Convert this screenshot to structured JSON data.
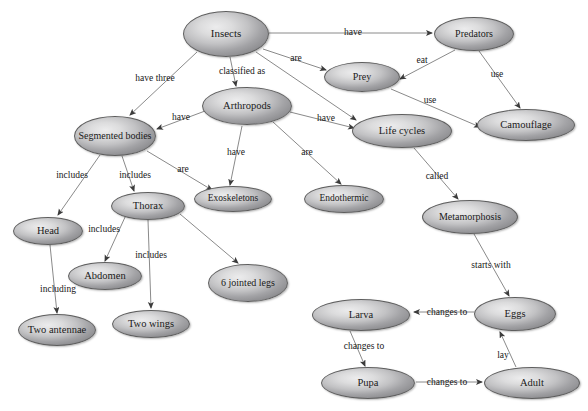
{
  "diagram": {
    "type": "concept-map",
    "canvas": {
      "width": 588,
      "height": 411
    },
    "style": {
      "node_fill_light": "#ececed",
      "node_fill_dark": "#8d8d90",
      "node_border": "#5e5e5e",
      "edge_color": "#8a8a8a",
      "text_color": "#1a1a1a",
      "background": "#ffffff"
    },
    "nodes": [
      {
        "id": "insects",
        "label": "Insects",
        "cx": 226,
        "cy": 34,
        "rx": 43,
        "ry": 23,
        "fontSize": 11
      },
      {
        "id": "predators",
        "label": "Predators",
        "cx": 474,
        "cy": 34,
        "rx": 40,
        "ry": 17,
        "fontSize": 10
      },
      {
        "id": "prey",
        "label": "Prey",
        "cx": 362,
        "cy": 77,
        "rx": 38,
        "ry": 15,
        "fontSize": 10
      },
      {
        "id": "arthropods",
        "label": "Arthropods",
        "cx": 247,
        "cy": 106,
        "rx": 45,
        "ry": 19,
        "fontSize": 10.5
      },
      {
        "id": "segmented",
        "label": "Segmented bodies",
        "cx": 115,
        "cy": 136,
        "rx": 41,
        "ry": 20,
        "fontSize": 10
      },
      {
        "id": "lifecycles",
        "label": "Life cycles",
        "cx": 402,
        "cy": 131,
        "rx": 50,
        "ry": 17,
        "fontSize": 10.5
      },
      {
        "id": "camouflage",
        "label": "Camouflage",
        "cx": 526,
        "cy": 125,
        "rx": 49,
        "ry": 16,
        "fontSize": 10.5
      },
      {
        "id": "exoskeletons",
        "label": "Exoskeletons",
        "cx": 233,
        "cy": 199,
        "rx": 39,
        "ry": 13,
        "fontSize": 9.5
      },
      {
        "id": "endothermic",
        "label": "Endothermic",
        "cx": 344,
        "cy": 199,
        "rx": 40,
        "ry": 14,
        "fontSize": 9.5
      },
      {
        "id": "thorax",
        "label": "Thorax",
        "cx": 148,
        "cy": 206,
        "rx": 37,
        "ry": 14,
        "fontSize": 10.5
      },
      {
        "id": "metamorphosis",
        "label": "Metamorphosis",
        "cx": 470,
        "cy": 217,
        "rx": 48,
        "ry": 17,
        "fontSize": 10
      },
      {
        "id": "head",
        "label": "Head",
        "cx": 48,
        "cy": 231,
        "rx": 35,
        "ry": 14,
        "fontSize": 10.5
      },
      {
        "id": "abdomen",
        "label": "Abdomen",
        "cx": 105,
        "cy": 276,
        "rx": 37,
        "ry": 14,
        "fontSize": 10.5
      },
      {
        "id": "jointedlegs",
        "label": "6 jointed legs",
        "cx": 248,
        "cy": 283,
        "rx": 40,
        "ry": 19,
        "fontSize": 10
      },
      {
        "id": "larva",
        "label": "Larva",
        "cx": 361,
        "cy": 315,
        "rx": 49,
        "ry": 16,
        "fontSize": 10.5
      },
      {
        "id": "eggs",
        "label": "Eggs",
        "cx": 515,
        "cy": 314,
        "rx": 41,
        "ry": 17,
        "fontSize": 10.5
      },
      {
        "id": "twowings",
        "label": "Two wings",
        "cx": 151,
        "cy": 324,
        "rx": 39,
        "ry": 14,
        "fontSize": 10.5
      },
      {
        "id": "twoantennae",
        "label": "Two antennae",
        "cx": 57,
        "cy": 330,
        "rx": 39,
        "ry": 16,
        "fontSize": 10.5
      },
      {
        "id": "pupa",
        "label": "Pupa",
        "cx": 368,
        "cy": 383,
        "rx": 47,
        "ry": 16,
        "fontSize": 10.5
      },
      {
        "id": "adult",
        "label": "Adult",
        "cx": 532,
        "cy": 383,
        "rx": 48,
        "ry": 16,
        "fontSize": 10.5
      }
    ],
    "edges": [
      {
        "from": "insects",
        "to": "predators",
        "label": "have",
        "lx": 353,
        "ly": 33,
        "x1": 269,
        "y1": 33,
        "x2": 432,
        "y2": 33
      },
      {
        "from": "insects",
        "to": "prey",
        "label": "are",
        "lx": 296,
        "ly": 59,
        "x1": 263,
        "y1": 49,
        "x2": 326,
        "y2": 70
      },
      {
        "from": "insects",
        "to": "segmented",
        "label": "have three",
        "lx": 155,
        "ly": 79,
        "x1": 197,
        "y1": 52,
        "x2": 130,
        "y2": 115
      },
      {
        "from": "insects",
        "to": "arthropods",
        "label": "classified as",
        "lx": 242,
        "ly": 72,
        "x1": 230,
        "y1": 57,
        "x2": 236,
        "y2": 86
      },
      {
        "from": "predators",
        "to": "prey",
        "label": "eat",
        "lx": 422,
        "ly": 61,
        "x1": 455,
        "y1": 50,
        "x2": 400,
        "y2": 79
      },
      {
        "from": "predators",
        "to": "camouflage",
        "label": "use",
        "lx": 497,
        "ly": 75,
        "x1": 479,
        "y1": 51,
        "x2": 520,
        "y2": 108
      },
      {
        "from": "prey",
        "to": "camouflage",
        "label": "use",
        "lx": 430,
        "ly": 101,
        "x1": 391,
        "y1": 89,
        "x2": 480,
        "y2": 127
      },
      {
        "from": "insects",
        "to": "lifecycles",
        "label": "",
        "lx": 0,
        "ly": 0,
        "x1": 256,
        "y1": 52,
        "x2": 356,
        "y2": 120
      },
      {
        "from": "arthropods",
        "to": "segmented",
        "label": "have",
        "lx": 181,
        "ly": 118,
        "x1": 205,
        "y1": 111,
        "x2": 157,
        "y2": 129
      },
      {
        "from": "arthropods",
        "to": "lifecycles",
        "label": "have",
        "lx": 326,
        "ly": 119,
        "x1": 290,
        "y1": 112,
        "x2": 354,
        "y2": 128
      },
      {
        "from": "arthropods",
        "to": "exoskeletons",
        "label": "have",
        "lx": 236,
        "ly": 153,
        "x1": 242,
        "y1": 126,
        "x2": 230,
        "y2": 185
      },
      {
        "from": "arthropods",
        "to": "endothermic",
        "label": "are",
        "lx": 307,
        "ly": 153,
        "x1": 273,
        "y1": 122,
        "x2": 341,
        "y2": 184
      },
      {
        "from": "segmented",
        "to": "head",
        "lx": 72,
        "ly": 176,
        "label": "includes",
        "x1": 100,
        "y1": 155,
        "x2": 58,
        "y2": 215
      },
      {
        "from": "segmented",
        "to": "thorax",
        "label": "includes",
        "lx": 135,
        "ly": 176,
        "x1": 122,
        "y1": 156,
        "x2": 134,
        "y2": 191
      },
      {
        "from": "segmented",
        "to": "exoskeletons",
        "label": "are",
        "lx": 183,
        "ly": 170,
        "x1": 147,
        "y1": 151,
        "x2": 212,
        "y2": 190
      },
      {
        "from": "thorax",
        "to": "abdomen",
        "label": "includes",
        "lx": 104,
        "ly": 230,
        "x1": 126,
        "y1": 215,
        "x2": 105,
        "y2": 261
      },
      {
        "from": "thorax",
        "to": "twowings",
        "label": "includes",
        "lx": 151,
        "ly": 256,
        "x1": 148,
        "y1": 220,
        "x2": 151,
        "y2": 308
      },
      {
        "from": "thorax",
        "to": "jointedlegs",
        "label": "",
        "lx": 0,
        "ly": 0,
        "x1": 180,
        "y1": 214,
        "x2": 238,
        "y2": 263
      },
      {
        "from": "head",
        "to": "twoantennae",
        "label": "including",
        "lx": 58,
        "ly": 290,
        "x1": 50,
        "y1": 245,
        "x2": 57,
        "y2": 313
      },
      {
        "from": "lifecycles",
        "to": "metamorphosis",
        "label": "called",
        "lx": 437,
        "ly": 177,
        "x1": 414,
        "y1": 148,
        "x2": 458,
        "y2": 199
      },
      {
        "from": "metamorphosis",
        "to": "eggs",
        "label": "starts with",
        "lx": 491,
        "ly": 266,
        "x1": 474,
        "y1": 234,
        "x2": 509,
        "y2": 296
      },
      {
        "from": "eggs",
        "to": "larva",
        "label": "changes to",
        "lx": 447,
        "ly": 313,
        "x1": 474,
        "y1": 312,
        "x2": 414,
        "y2": 312
      },
      {
        "from": "larva",
        "to": "pupa",
        "label": "changes to",
        "lx": 364,
        "ly": 347,
        "x1": 350,
        "y1": 331,
        "x2": 365,
        "y2": 366
      },
      {
        "from": "pupa",
        "to": "adult",
        "label": "changes to",
        "lx": 447,
        "ly": 383,
        "x1": 416,
        "y1": 382,
        "x2": 482,
        "y2": 382
      },
      {
        "from": "adult",
        "to": "eggs",
        "label": "lay",
        "lx": 503,
        "ly": 356,
        "x1": 516,
        "y1": 367,
        "x2": 500,
        "y2": 332
      }
    ]
  }
}
